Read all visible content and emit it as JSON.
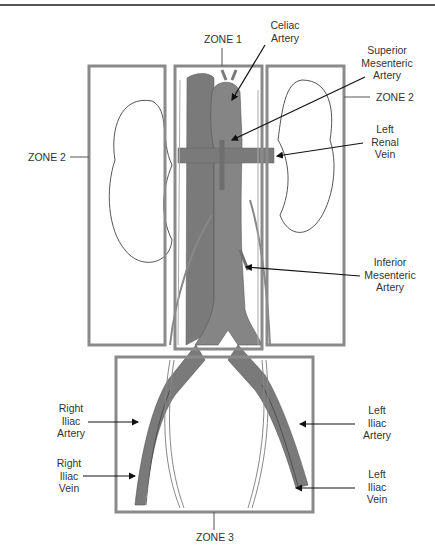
{
  "diagram": {
    "zones": [
      {
        "id": "zone1",
        "label": "ZONE 1"
      },
      {
        "id": "zone2_left",
        "label": "ZONE 2"
      },
      {
        "id": "zone2_right",
        "label": "ZONE 2"
      },
      {
        "id": "zone3",
        "label": "ZONE 3"
      }
    ],
    "structures": {
      "celiac_artery": "Celiac\nArtery",
      "superior_mesenteric_artery": "Superior\nMesenteric\nArtery",
      "left_renal_vein": "Left\nRenal\nVein",
      "inferior_mesenteric_artery": "Inferior\nMesenteric\nArtery",
      "right_iliac_artery": "Right\nIliac\nArtery",
      "right_iliac_vein": "Right\nIliac\nVein",
      "left_iliac_artery": "Left\nIliac\nArtery",
      "left_iliac_vein": "Left\nIliac\nVein"
    },
    "colors": {
      "zone_box": "#8a8a8a",
      "vessel_fill": "#7a7a7a",
      "vessel_dark": "#5e5e5e",
      "outline": "#444444",
      "leader": "#111111"
    }
  }
}
